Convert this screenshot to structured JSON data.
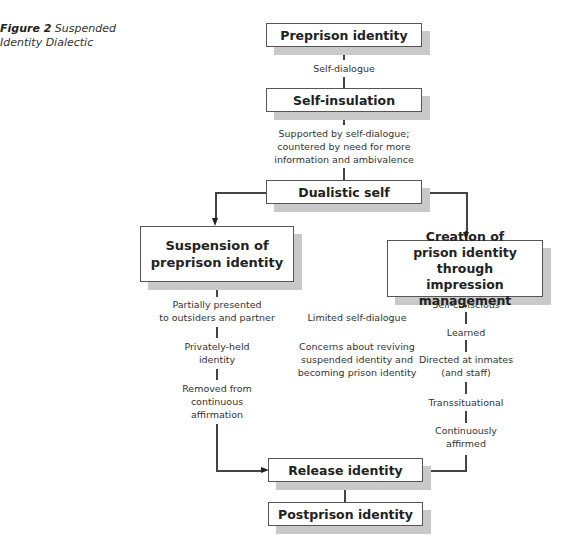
{
  "caption": {
    "label": "Figure 2",
    "title_line1": "Suspended",
    "title_line2": "Identity Dialectic"
  },
  "nodes": {
    "preprison": "Preprison identity",
    "self_insulation": "Self-insulation",
    "dualistic": "Dualistic self",
    "suspension_line1": "Suspension of",
    "suspension_line2": "preprison identity",
    "creation_line1": "Creation of",
    "creation_line2": "prison identity through",
    "creation_line3": "impression management",
    "release": "Release identity",
    "postprison": "Postprison identity"
  },
  "edges": {
    "self_dialogue": "Self-dialogue",
    "supported_line1": "Supported by self-dialogue;",
    "supported_line2": "countered by need for more",
    "supported_line3": "information and ambivalence"
  },
  "left_column": {
    "item1_line1": "Partially presented",
    "item1_line2": "to outsiders and partner",
    "item2_line1": "Privately-held",
    "item2_line2": "identity",
    "item3_line1": "Removed from",
    "item3_line2": "continuous",
    "item3_line3": "affirmation"
  },
  "middle_column": {
    "item1": "Limited self-dialogue",
    "item2_line1": "Concerns about reviving",
    "item2_line2": "suspended identity and",
    "item2_line3": "becoming prison identity"
  },
  "right_column": {
    "item1": "Self-conscious",
    "item2": "Learned",
    "item3_line1": "Directed at inmates",
    "item3_line2": "(and staff)",
    "item4": "Transsituational",
    "item5_line1": "Continuously",
    "item5_line2": "affirmed"
  }
}
